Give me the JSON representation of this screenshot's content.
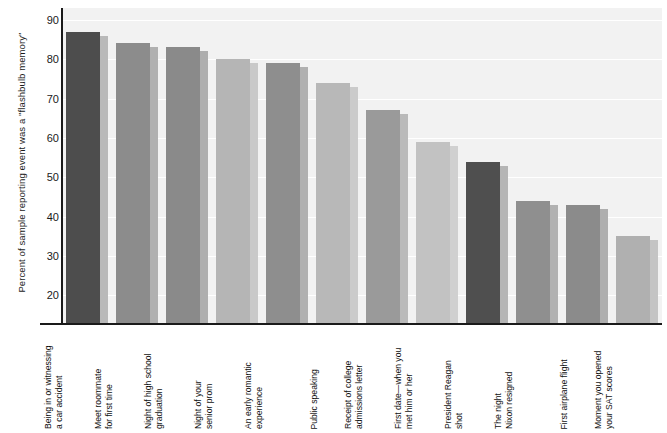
{
  "chart_data": {
    "type": "bar",
    "title": "",
    "subtitle": "",
    "xlabel": "",
    "ylabel": "Percent of sample reporting event was a \"flashbulb memory\"",
    "ylim": [
      13,
      93
    ],
    "yticks": [
      20,
      30,
      40,
      50,
      60,
      70,
      80,
      90
    ],
    "ytick_labels": [
      "20",
      "30",
      "40",
      "50",
      "60",
      "70",
      "80",
      "90"
    ],
    "grid": true,
    "legend": "none",
    "categories": [
      "Being in or witnessing a car accident",
      "Meet roommate for first time",
      "Night of high school graduation",
      "Night of your senior prom",
      "An early romantic experience",
      "Public speaking",
      "Receipt of college admissions letter",
      "First date—when you met him or her",
      "President Reagan shot",
      "The night Nixon resigned",
      "First airplane flight",
      "Moment you opened your SAT scores"
    ],
    "category_lines": [
      [
        "Being in or witnessing",
        "a car accident"
      ],
      [
        "Meet roommate",
        "for first time"
      ],
      [
        "Night of high school",
        "graduation"
      ],
      [
        "Night of your",
        "senior prom"
      ],
      [
        "An early romantic",
        "experience"
      ],
      [
        "Public speaking",
        ""
      ],
      [
        "Receipt of college",
        "admissions letter"
      ],
      [
        "First date—when you",
        "met him or her"
      ],
      [
        "President Reagan",
        "shot"
      ],
      [
        "The night",
        "Nixon resigned"
      ],
      [
        "First airplane flight",
        ""
      ],
      [
        "Moment you opened",
        "your SAT scores"
      ]
    ],
    "values": [
      87,
      84,
      83,
      80,
      79,
      74,
      67,
      59,
      54,
      44,
      43,
      35
    ],
    "bar_colors": [
      "#4d4d4d",
      "#8c8c8c",
      "#8a8a8a",
      "#b5b5b5",
      "#8e8e8e",
      "#b8b8b8",
      "#9a9a9a",
      "#c2c2c2",
      "#4f4f4f",
      "#8f8f8f",
      "#8b8b8b",
      "#b0b0b0"
    ],
    "shadow_colors": [
      "#b9b9b9",
      "#b0b0b0",
      "#aeaeae",
      "#c9c9c9",
      "#b0b0b0",
      "#cbcbcb",
      "#bababa",
      "#d0d0d0",
      "#b5b5b5",
      "#b1b1b1",
      "#aeaeae",
      "#c4c4c4"
    ],
    "plot_background": "#f2f2f2",
    "gridline_color": "#ffffff",
    "axis_color": "#1a1a1a"
  }
}
